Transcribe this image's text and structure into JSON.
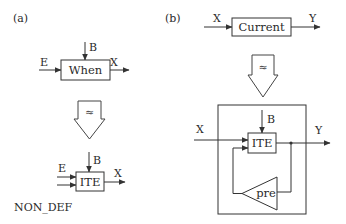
{
  "panel_a": {
    "label": "(a)",
    "top": {
      "block_label": "When",
      "input_left": "E",
      "input_top": "B",
      "output": "X"
    },
    "transform_symbol": "≈",
    "bottom": {
      "block_label": "ITE",
      "input_left": "E",
      "input_top": "B",
      "output": "X",
      "default_label": "NON_DEF"
    }
  },
  "panel_b": {
    "label": "(b)",
    "top": {
      "block_label": "Current",
      "input": "X",
      "output": "Y"
    },
    "transform_symbol": "≈",
    "bottom": {
      "block_label": "ITE",
      "input_left": "X",
      "input_top": "B",
      "output": "Y",
      "feedback_block_label": "pre"
    }
  },
  "colors": {
    "stroke": "#333333",
    "text": "#2a2a2a",
    "background": "#ffffff"
  }
}
